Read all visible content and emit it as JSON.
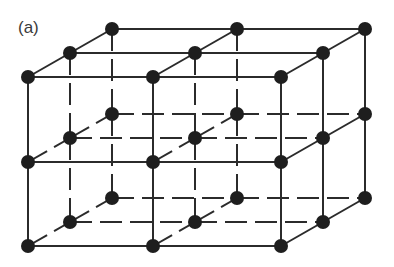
{
  "figure": {
    "label": "(a)",
    "colors": {
      "line": "#2b2b2b",
      "node": "#1e1e1e",
      "background": "#ffffff"
    },
    "node_radius": 7,
    "line_width": 2,
    "lattice": {
      "x_front": [
        28,
        153,
        281
      ],
      "y_front_layers": [
        77,
        162,
        246
      ],
      "depth_step": {
        "dx": 42,
        "dy": -24
      },
      "size": [
        3,
        3,
        3
      ]
    },
    "hidden_style": {
      "dash": "22 8"
    }
  }
}
